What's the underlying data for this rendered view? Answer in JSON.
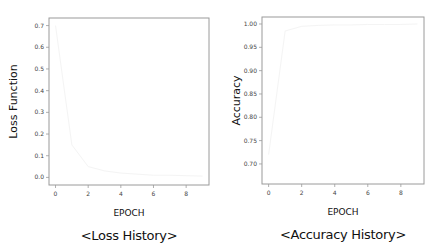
{
  "chart_data": [
    {
      "type": "line",
      "title": "<Loss History>",
      "xlabel": "EPOCH",
      "ylabel": "Loss Function",
      "x": [
        0,
        1,
        2,
        3,
        4,
        5,
        6,
        7,
        8,
        9
      ],
      "series": [
        {
          "name": "loss",
          "values": [
            0.7,
            0.15,
            0.05,
            0.03,
            0.02,
            0.015,
            0.01,
            0.01,
            0.008,
            0.006
          ],
          "color": "#f4f4f4"
        }
      ],
      "xticks": [
        "0",
        "2",
        "4",
        "6",
        "8"
      ],
      "yticks": [
        "0.0",
        "0.1",
        "0.2",
        "0.3",
        "0.4",
        "0.5",
        "0.6",
        "0.7"
      ],
      "xlim": [
        -0.4,
        9.4
      ],
      "ylim": [
        -0.035,
        0.735
      ],
      "grid": false,
      "legend": "none"
    },
    {
      "type": "line",
      "title": "<Accuracy History>",
      "xlabel": "EPOCH",
      "ylabel": "Accuracy",
      "x": [
        0,
        1,
        2,
        3,
        4,
        5,
        6,
        7,
        8,
        9
      ],
      "series": [
        {
          "name": "accuracy",
          "values": [
            0.72,
            0.985,
            0.995,
            0.997,
            0.998,
            0.998,
            0.999,
            0.999,
            0.999,
            1.0
          ],
          "color": "#f4f4f4"
        }
      ],
      "xticks": [
        "0",
        "2",
        "4",
        "6",
        "8"
      ],
      "yticks": [
        "0.70",
        "0.75",
        "0.80",
        "0.85",
        "0.90",
        "0.95",
        "1.00"
      ],
      "xlim": [
        -0.4,
        9.4
      ],
      "ylim": [
        0.657,
        1.015
      ],
      "grid": false,
      "legend": "none"
    }
  ],
  "charts": {
    "loss": {
      "xlabel": "EPOCH",
      "ylabel": "Loss Function",
      "caption": "<Loss History>"
    },
    "accuracy": {
      "xlabel": "EPOCH",
      "ylabel": "Accuracy",
      "caption": "<Accuracy History>"
    }
  },
  "colors": {
    "axis": "#9a9a9a",
    "line": "#f4f4f4",
    "text": "#222222"
  }
}
